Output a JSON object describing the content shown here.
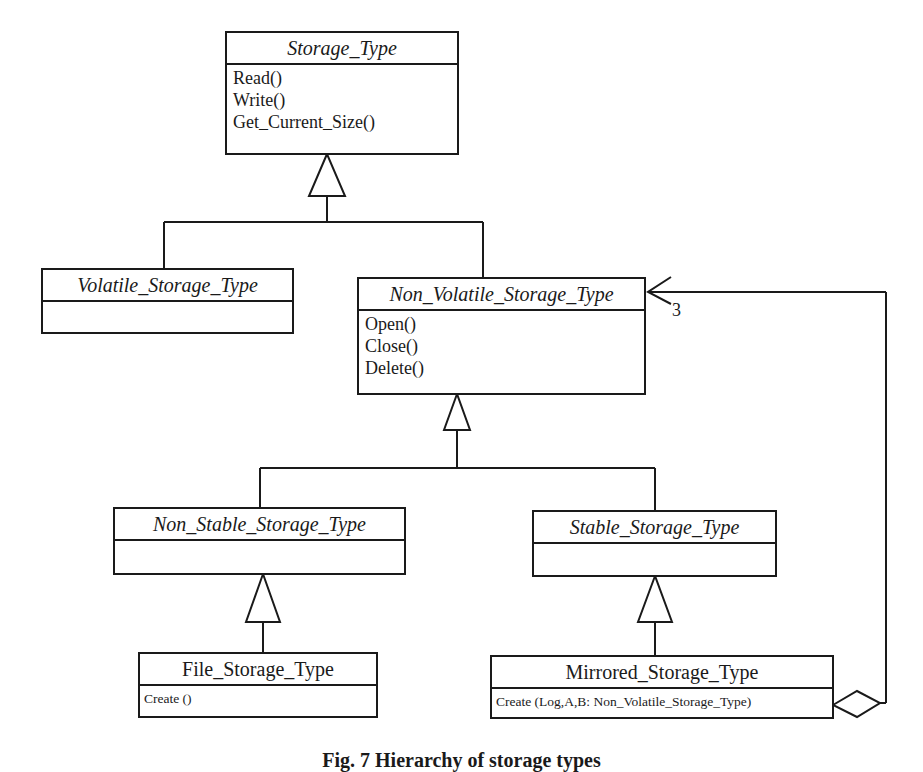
{
  "diagram": {
    "type": "UML class diagram",
    "classes": [
      {
        "id": "storage_type",
        "name": "Storage_Type",
        "abstract": true,
        "operations": [
          "Read()",
          "Write()",
          "Get_Current_Size()"
        ]
      },
      {
        "id": "volatile_storage_type",
        "name": "Volatile_Storage_Type",
        "abstract": true,
        "operations": []
      },
      {
        "id": "non_volatile_storage_type",
        "name": "Non_Volatile_Storage_Type",
        "abstract": true,
        "operations": [
          "Open()",
          "Close()",
          "Delete()"
        ]
      },
      {
        "id": "non_stable_storage_type",
        "name": "Non_Stable_Storage_Type",
        "abstract": true,
        "operations": []
      },
      {
        "id": "stable_storage_type",
        "name": "Stable_Storage_Type",
        "abstract": true,
        "operations": []
      },
      {
        "id": "file_storage_type",
        "name": "File_Storage_Type",
        "abstract": false,
        "operations": [
          "Create ()"
        ]
      },
      {
        "id": "mirrored_storage_type",
        "name": "Mirrored_Storage_Type",
        "abstract": false,
        "operations": [
          "Create (Log,A,B: Non_Volatile_Storage_Type)"
        ]
      }
    ],
    "relationships": [
      {
        "type": "generalization",
        "child": "Volatile_Storage_Type",
        "parent": "Storage_Type"
      },
      {
        "type": "generalization",
        "child": "Non_Volatile_Storage_Type",
        "parent": "Storage_Type"
      },
      {
        "type": "generalization",
        "child": "Non_Stable_Storage_Type",
        "parent": "Non_Volatile_Storage_Type"
      },
      {
        "type": "generalization",
        "child": "Stable_Storage_Type",
        "parent": "Non_Volatile_Storage_Type"
      },
      {
        "type": "generalization",
        "child": "File_Storage_Type",
        "parent": "Non_Stable_Storage_Type"
      },
      {
        "type": "generalization",
        "child": "Mirrored_Storage_Type",
        "parent": "Stable_Storage_Type"
      },
      {
        "type": "aggregation",
        "whole": "Mirrored_Storage_Type",
        "part": "Non_Volatile_Storage_Type",
        "multiplicity": "3"
      }
    ],
    "caption": "Fig. 7 Hierarchy of storage types"
  }
}
